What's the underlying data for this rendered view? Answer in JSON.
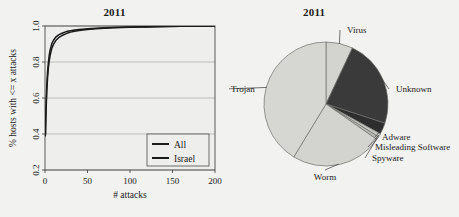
{
  "figure": {
    "background_color": "#f2f2f0",
    "panels": [
      "line-chart-2011",
      "pie-chart-2011"
    ]
  },
  "chart_data": [
    {
      "type": "line",
      "title": "2011",
      "xlabel": "# attacks",
      "ylabel": "% hosts with <= x attacks",
      "xlim": [
        0,
        200
      ],
      "ylim": [
        0.2,
        1.0
      ],
      "xticks": [
        "0",
        "50",
        "100",
        "150",
        "200"
      ],
      "xtick_values": [
        0,
        50,
        100,
        150,
        200
      ],
      "yticks": [
        "0.2",
        "0.4",
        "0.6",
        "0.8",
        "1.0"
      ],
      "ytick_values": [
        0.2,
        0.4,
        0.6,
        0.8,
        1.0
      ],
      "grid": true,
      "legend_position": "bottom-right",
      "series": [
        {
          "name": "All",
          "color": "#1a1a1a",
          "x": [
            0.5,
            1,
            2,
            3,
            4,
            5,
            6,
            8,
            10,
            13,
            16,
            20,
            25,
            30,
            35,
            40,
            50,
            60,
            70,
            80,
            100,
            120,
            140,
            160,
            180,
            200
          ],
          "y": [
            0.4,
            0.52,
            0.66,
            0.745,
            0.8,
            0.838,
            0.866,
            0.902,
            0.921,
            0.94,
            0.951,
            0.96,
            0.969,
            0.974,
            0.978,
            0.981,
            0.985,
            0.988,
            0.99,
            0.992,
            0.994,
            0.996,
            0.997,
            0.998,
            0.999,
            1.0
          ]
        },
        {
          "name": "Israel",
          "color": "#1a1a1a",
          "x": [
            0.5,
            1,
            2,
            3,
            4,
            5,
            6,
            8,
            10,
            13,
            16,
            20,
            25,
            30,
            35,
            40,
            50,
            60,
            70,
            80,
            100,
            120,
            140,
            160,
            180,
            200
          ],
          "y": [
            0.39,
            0.495,
            0.628,
            0.712,
            0.768,
            0.806,
            0.836,
            0.876,
            0.898,
            0.921,
            0.935,
            0.947,
            0.958,
            0.966,
            0.971,
            0.975,
            0.981,
            0.985,
            0.988,
            0.99,
            0.993,
            0.995,
            0.997,
            0.998,
            0.999,
            1.0
          ]
        }
      ],
      "legend_entries": [
        {
          "label": "All"
        },
        {
          "label": "Israel"
        }
      ]
    },
    {
      "type": "pie",
      "title": "2011",
      "categories": [
        "Virus",
        "Unknown",
        "Adware",
        "Misleading Software",
        "Spyware",
        "Worm",
        "Trojan"
      ],
      "values": [
        7.0,
        23.0,
        3.0,
        0.9,
        0.8,
        24.0,
        41.3
      ],
      "colors": [
        "#d3d3d0",
        "#3a3a3a",
        "#2e2e2e",
        "#c8c8c5",
        "#b8b8b4",
        "#d3d3d0",
        "#d6d6d3"
      ],
      "start_angle_deg": 90,
      "direction": "clockwise",
      "labels_outside": true,
      "slices": [
        {
          "label": "Virus",
          "value": 7.0,
          "color": "#d3d3d0"
        },
        {
          "label": "Unknown",
          "value": 23.0,
          "color": "#3a3a3a"
        },
        {
          "label": "Adware",
          "value": 3.0,
          "color": "#2e2e2e"
        },
        {
          "label": "Misleading Software",
          "value": 0.9,
          "color": "#c8c8c5"
        },
        {
          "label": "Spyware",
          "value": 0.8,
          "color": "#b8b8b4"
        },
        {
          "label": "Worm",
          "value": 24.0,
          "color": "#d3d3d0"
        },
        {
          "label": "Trojan",
          "value": 41.3,
          "color": "#d6d6d3"
        }
      ]
    }
  ]
}
